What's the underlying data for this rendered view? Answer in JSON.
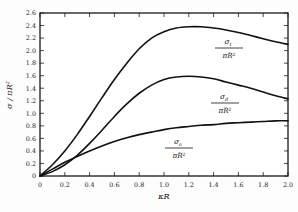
{
  "chart_data": {
    "type": "line",
    "title": "",
    "subtitle": "",
    "xlabel": "κ R",
    "ylabel": "σ / π R²",
    "xlim": [
      0,
      2.0
    ],
    "ylim": [
      0,
      2.6
    ],
    "grid": false,
    "legend_position": "inline-annotations",
    "xticks": [
      "0",
      "0.2",
      "0.4",
      "0.6",
      "0.8",
      "1.0",
      "1.2",
      "1.4",
      "1.6",
      "1.8",
      "2.0"
    ],
    "xtick_values": [
      0,
      0.2,
      0.4,
      0.6,
      0.8,
      1.0,
      1.2,
      1.4,
      1.6,
      1.8,
      2.0
    ],
    "yticks": [
      "0",
      "0.2",
      "0.4",
      "0.6",
      "0.8",
      "1.0",
      "1.2",
      "1.4",
      "1.6",
      "1.8",
      "2.0",
      "2.2",
      "2.4",
      "2.6"
    ],
    "ytick_values": [
      0,
      0.2,
      0.4,
      0.6,
      0.8,
      1.0,
      1.2,
      1.4,
      1.6,
      1.8,
      2.0,
      2.2,
      2.4,
      2.6
    ],
    "x": [
      0,
      0.1,
      0.2,
      0.3,
      0.4,
      0.5,
      0.6,
      0.7,
      0.8,
      0.9,
      1.0,
      1.1,
      1.2,
      1.3,
      1.4,
      1.5,
      1.6,
      1.7,
      1.8,
      1.9,
      2.0
    ],
    "series": [
      {
        "name": "sigma_t",
        "label_numerator": "σ",
        "label_subscript": "t",
        "label_denominator": "πR²",
        "color": "#111111",
        "values": [
          0.0,
          0.18,
          0.4,
          0.66,
          0.95,
          1.25,
          1.54,
          1.8,
          2.03,
          2.2,
          2.3,
          2.36,
          2.38,
          2.38,
          2.36,
          2.33,
          2.29,
          2.24,
          2.19,
          2.14,
          2.1
        ]
      },
      {
        "name": "sigma_d",
        "label_numerator": "σ",
        "label_subscript": "d",
        "label_denominator": "πR²",
        "color": "#111111",
        "values": [
          0.0,
          0.07,
          0.18,
          0.33,
          0.52,
          0.73,
          0.95,
          1.15,
          1.32,
          1.45,
          1.54,
          1.58,
          1.59,
          1.58,
          1.55,
          1.5,
          1.45,
          1.4,
          1.34,
          1.28,
          1.23
        ]
      },
      {
        "name": "sigma_a",
        "label_numerator": "σ",
        "label_subscript": "a",
        "label_denominator": "πR²",
        "color": "#111111",
        "values": [
          0.0,
          0.11,
          0.22,
          0.31,
          0.4,
          0.48,
          0.55,
          0.61,
          0.66,
          0.7,
          0.74,
          0.77,
          0.79,
          0.81,
          0.82,
          0.84,
          0.85,
          0.86,
          0.87,
          0.88,
          0.88
        ]
      }
    ],
    "annotations": [
      {
        "name": "sigma-t-label",
        "text": "σ_t / πR²",
        "x": 1.55,
        "y": 2.05
      },
      {
        "name": "sigma-d-label",
        "text": "σ_d / πR²",
        "x": 1.48,
        "y": 1.3
      },
      {
        "name": "sigma-a-label",
        "text": "σ_a / πR²",
        "x": 1.08,
        "y": 0.55
      }
    ]
  },
  "axis": {
    "x_label_text": "κR",
    "y_label_sigma": "σ",
    "y_label_denominator": "πR²",
    "y_slash": "/"
  },
  "colors": {
    "background": "#fdfdfd",
    "axis": "#1a1a1a",
    "curve": "#111111"
  }
}
